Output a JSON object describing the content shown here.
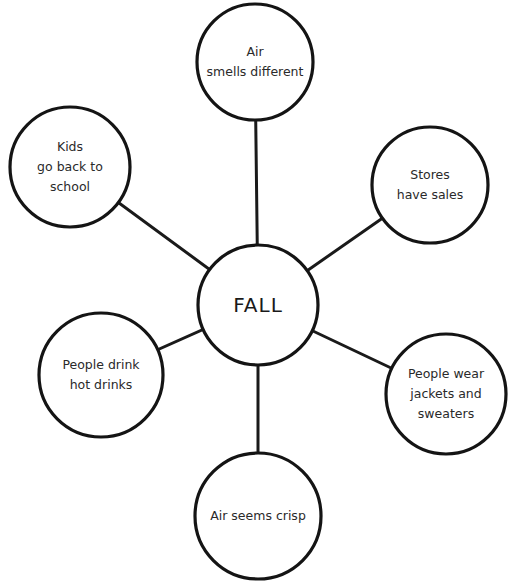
{
  "diagram": {
    "type": "concept-web",
    "center": {
      "label": "FALL"
    },
    "nodes": [
      {
        "id": "top",
        "lines": [
          "Air",
          "smells different"
        ]
      },
      {
        "id": "top-left",
        "lines": [
          "Kids",
          "go back to",
          "school"
        ]
      },
      {
        "id": "right",
        "lines": [
          "Stores",
          "have sales"
        ]
      },
      {
        "id": "left",
        "lines": [
          "People drink",
          "hot drinks"
        ]
      },
      {
        "id": "bottom-right",
        "lines": [
          "People wear",
          "jackets and",
          "sweaters"
        ]
      },
      {
        "id": "bottom",
        "lines": [
          "Air seems crisp"
        ]
      }
    ],
    "edges": [
      [
        "center",
        "top"
      ],
      [
        "center",
        "top-left"
      ],
      [
        "center",
        "right"
      ],
      [
        "center",
        "left"
      ],
      [
        "center",
        "bottom-right"
      ],
      [
        "center",
        "bottom"
      ]
    ],
    "colors": {
      "stroke": "#141414",
      "text": "#2a2a2a",
      "background": "#ffffff"
    }
  }
}
